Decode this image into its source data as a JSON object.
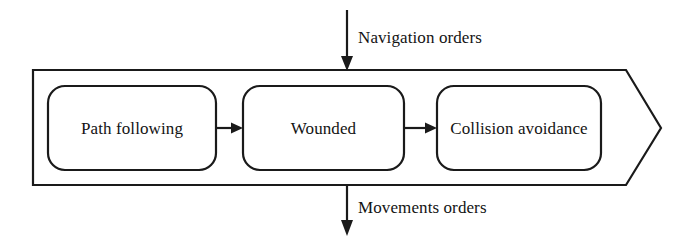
{
  "diagram": {
    "type": "block-flow-diagram",
    "container": {
      "shape": "pentagon-arrow-right",
      "stroke_color": "#1a1a1a",
      "fill_color": "#ffffff"
    },
    "nodes": [
      {
        "id": "path-following",
        "label": "Path following"
      },
      {
        "id": "wounded",
        "label": "Wounded"
      },
      {
        "id": "collision-avoidance",
        "label": "Collision avoidance"
      }
    ],
    "connectors": [
      {
        "from": "path-following",
        "to": "wounded",
        "style": "arrow-right"
      },
      {
        "from": "wounded",
        "to": "collision-avoidance",
        "style": "arrow-right"
      }
    ],
    "flows": [
      {
        "id": "navigation-orders",
        "label": "Navigation orders",
        "direction": "into-container-from-top"
      },
      {
        "id": "movements-orders",
        "label": "Movements orders",
        "direction": "out-of-container-downward"
      }
    ]
  }
}
